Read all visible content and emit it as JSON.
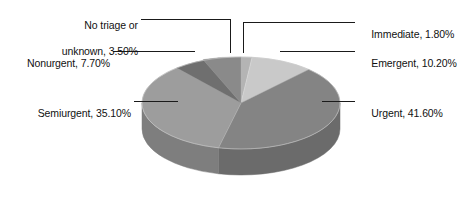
{
  "chart_data": {
    "type": "pie",
    "title": "",
    "subtitle": "",
    "xlabel": "",
    "ylabel": "",
    "legend_position": "none",
    "grid": false,
    "three_d": true,
    "units": "percent",
    "categories": [
      "Immediate",
      "Emergent",
      "Urgent",
      "Semiurgent",
      "Nonurgent",
      "No triage or unknown"
    ],
    "values": [
      1.8,
      10.2,
      41.6,
      35.1,
      7.7,
      3.5
    ],
    "slices": [
      {
        "name": "Immediate",
        "label": "Immediate, 1.80%",
        "value": 1.8,
        "color": "#b4b4b4",
        "side_color": "#8e8e8e",
        "label_side": "right"
      },
      {
        "name": "Emergent",
        "label": "Emergent, 10.20%",
        "value": 10.2,
        "color": "#c9c9c9",
        "side_color": "#a3a3a3",
        "label_side": "right"
      },
      {
        "name": "Urgent",
        "label": "Urgent, 41.60%",
        "value": 41.6,
        "color": "#848484",
        "side_color": "#6b6b6b",
        "label_side": "right"
      },
      {
        "name": "Semiurgent",
        "label": "Semiurgent, 35.10%",
        "value": 35.1,
        "color": "#9d9d9d",
        "side_color": "#7e7e7e",
        "label_side": "left"
      },
      {
        "name": "Nonurgent",
        "label": "Nonurgent, 7.70%",
        "value": 7.7,
        "color": "#6f6f6f",
        "side_color": "#5a5a5a",
        "label_side": "left"
      },
      {
        "name": "No triage or unknown",
        "label": "No triage or unknown, 3.50%",
        "value": 3.5,
        "color": "#8a8a8a",
        "side_color": "#6f6f6f",
        "label_side": "left"
      }
    ]
  },
  "labels": {
    "no_triage_line1": "No triage or",
    "no_triage_line2": "unknown, 3.50%",
    "nonurgent": "Nonurgent, 7.70%",
    "semiurgent": "Semiurgent, 35.10%",
    "immediate": "Immediate, 1.80%",
    "emergent": "Emergent, 10.20%",
    "urgent": "Urgent, 41.60%"
  },
  "colors": {
    "background": "#ffffff",
    "leader_line": "#1a1a1a",
    "text": "#111111",
    "slice_outline": "#d8d8d8"
  }
}
